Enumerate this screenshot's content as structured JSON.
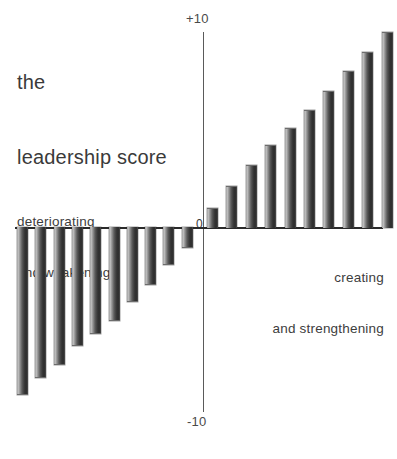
{
  "title": {
    "line1": "the",
    "line2": "leadership score"
  },
  "annotations": {
    "left": {
      "line1": "deteriorating",
      "line2": "and weakening"
    },
    "right": {
      "line1": "creating",
      "line2": "and strengthening"
    }
  },
  "axis_labels": {
    "top": "+10",
    "zero": "0",
    "bottom": "-10"
  },
  "chart_data": {
    "type": "bar",
    "title": "the leadership score",
    "subtitle": "",
    "xlabel": "",
    "ylabel": "",
    "ylim": [
      -10,
      10
    ],
    "yticks": [
      -10,
      0,
      10
    ],
    "ytick_labels": [
      "-10",
      "0",
      "+10"
    ],
    "grid": false,
    "legend": "none",
    "orientation": "vertical",
    "diverging": true,
    "zero_line": true,
    "annotations": [
      {
        "text": "deteriorating and weakening",
        "side": "left",
        "region": "negative"
      },
      {
        "text": "creating and strengthening",
        "side": "right",
        "region": "positive"
      }
    ],
    "categories": [
      "n1",
      "n2",
      "n3",
      "n4",
      "n5",
      "n6",
      "n7",
      "n8",
      "n9",
      "n10",
      "p1",
      "p2",
      "p3",
      "p4",
      "p5",
      "p6",
      "p7",
      "p8",
      "p9",
      "p10"
    ],
    "values": [
      -9.0,
      -8.1,
      -7.4,
      -6.4,
      -5.7,
      -5.0,
      -4.0,
      -3.1,
      -2.0,
      -1.1,
      1.0,
      2.1,
      3.2,
      4.2,
      5.1,
      6.0,
      7.0,
      8.0,
      9.0,
      10.0
    ],
    "bar_color": "#3a3a3a",
    "bar_style": "cylindrical-gradient"
  }
}
